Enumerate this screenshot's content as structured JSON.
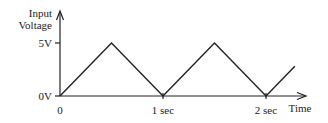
{
  "chart_data": {
    "type": "line",
    "title": "",
    "xlabel": "Time",
    "ylabel": "Input Voltage",
    "ylabel_lines": [
      "Input",
      "Voltage"
    ],
    "x_unit": "sec",
    "y_unit": "V",
    "xlim": [
      0,
      2.4
    ],
    "ylim": [
      0,
      7
    ],
    "x_ticks": [
      {
        "value": 0,
        "label": "0"
      },
      {
        "value": 1,
        "label": "1 sec"
      },
      {
        "value": 2,
        "label": "2 sec"
      }
    ],
    "y_ticks": [
      {
        "value": 0,
        "label": "0V"
      },
      {
        "value": 5,
        "label": "5V"
      }
    ],
    "grid": false,
    "series": [
      {
        "name": "Triangle wave",
        "x": [
          0,
          0.5,
          1,
          1.5,
          2,
          2.28
        ],
        "y": [
          0,
          5,
          0,
          5,
          0,
          2.8
        ]
      }
    ]
  }
}
